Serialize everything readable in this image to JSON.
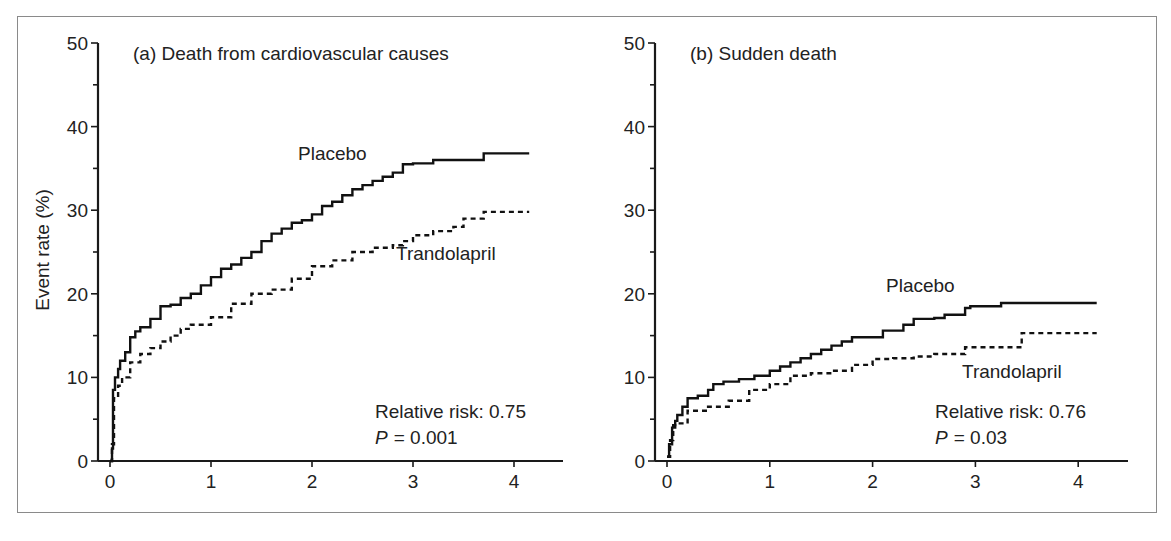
{
  "figure": {
    "y_axis_label": "Event rate (%)"
  },
  "chart_data": [
    {
      "type": "line",
      "panel": "a",
      "title": "(a) Death from cardiovascular causes",
      "xlabel": "",
      "ylabel": "Event rate (%)",
      "xlim": [
        0,
        4.5
      ],
      "ylim": [
        0,
        50
      ],
      "x_ticks": [
        "0",
        "1",
        "2",
        "3",
        "4"
      ],
      "y_ticks": [
        "0",
        "10",
        "20",
        "30",
        "40",
        "50"
      ],
      "grid": false,
      "series": [
        {
          "name": "Placebo",
          "style": "solid step",
          "x": [
            0,
            0.02,
            0.03,
            0.05,
            0.08,
            0.1,
            0.15,
            0.2,
            0.25,
            0.3,
            0.4,
            0.5,
            0.6,
            0.7,
            0.8,
            0.9,
            1.0,
            1.1,
            1.2,
            1.3,
            1.4,
            1.5,
            1.6,
            1.7,
            1.8,
            1.9,
            2.0,
            2.1,
            2.2,
            2.3,
            2.4,
            2.5,
            2.6,
            2.7,
            2.8,
            2.9,
            3.0,
            3.2,
            3.4,
            3.7,
            4.15
          ],
          "y": [
            0,
            1.5,
            8.5,
            10,
            11,
            12,
            13,
            14.8,
            15.5,
            16,
            17,
            18.5,
            18.7,
            19.5,
            20,
            21,
            22,
            23,
            23.5,
            24.3,
            25,
            26.3,
            27.2,
            27.8,
            28.5,
            28.8,
            29.5,
            30.5,
            31,
            31.8,
            32.5,
            33,
            33.5,
            34,
            34.5,
            35.5,
            35.6,
            36,
            36,
            36.8,
            36.8
          ]
        },
        {
          "name": "Trandolapril",
          "style": "dotted step",
          "x": [
            0,
            0.02,
            0.04,
            0.08,
            0.12,
            0.2,
            0.3,
            0.4,
            0.5,
            0.6,
            0.7,
            0.8,
            1.0,
            1.2,
            1.4,
            1.6,
            1.8,
            2.0,
            2.2,
            2.4,
            2.6,
            2.8,
            2.9,
            3.0,
            3.2,
            3.4,
            3.5,
            3.7,
            4.15
          ],
          "y": [
            0,
            2,
            7.5,
            9,
            10,
            11.8,
            12.8,
            13.5,
            14.3,
            15,
            15.8,
            16.3,
            17.2,
            18.8,
            20,
            20.5,
            21.8,
            23.3,
            24,
            25,
            25.5,
            25.8,
            26.3,
            27,
            27.5,
            28,
            29,
            29.8,
            29.8
          ]
        }
      ],
      "annotations": {
        "placebo_label": "Placebo",
        "trandolapril_label": "Trandolapril",
        "relative_risk": "Relative risk: 0.75",
        "p_symbol": "P",
        "p_value": "= 0.001"
      }
    },
    {
      "type": "line",
      "panel": "b",
      "title": "(b) Sudden death",
      "xlabel": "",
      "ylabel": "",
      "xlim": [
        0,
        4.5
      ],
      "ylim": [
        0,
        50
      ],
      "x_ticks": [
        "0",
        "1",
        "2",
        "3",
        "4"
      ],
      "y_ticks": [
        "0",
        "10",
        "20",
        "30",
        "40",
        "50"
      ],
      "grid": false,
      "series": [
        {
          "name": "Placebo",
          "style": "solid step",
          "x": [
            0,
            0.02,
            0.05,
            0.08,
            0.1,
            0.15,
            0.2,
            0.3,
            0.4,
            0.45,
            0.55,
            0.7,
            0.85,
            1.0,
            1.1,
            1.2,
            1.3,
            1.4,
            1.5,
            1.6,
            1.7,
            1.8,
            2.0,
            2.1,
            2.3,
            2.4,
            2.6,
            2.7,
            2.9,
            2.95,
            3.2,
            3.25,
            4.18
          ],
          "y": [
            0.5,
            2,
            4,
            4.8,
            5.5,
            6.5,
            7.5,
            7.8,
            8.5,
            9.2,
            9.5,
            9.8,
            10.2,
            10.8,
            11.3,
            11.8,
            12.3,
            12.8,
            13.3,
            13.8,
            14.3,
            14.8,
            14.8,
            15.6,
            16.3,
            17,
            17.1,
            17.5,
            18.3,
            18.5,
            18.5,
            18.9,
            18.9
          ]
        },
        {
          "name": "Trandolapril",
          "style": "dotted step",
          "x": [
            0,
            0.03,
            0.06,
            0.1,
            0.2,
            0.4,
            0.6,
            0.8,
            1.0,
            1.2,
            1.4,
            1.6,
            1.8,
            2.0,
            2.2,
            2.4,
            2.6,
            2.8,
            2.9,
            3.0,
            3.2,
            3.4,
            3.45,
            3.5,
            4.18
          ],
          "y": [
            0.5,
            2.5,
            4.3,
            4.5,
            6,
            6.5,
            7.2,
            8.5,
            9.2,
            10.2,
            10.5,
            10.8,
            11.5,
            12.2,
            12.3,
            12.5,
            12.8,
            12.8,
            13.6,
            13.6,
            13.6,
            13.6,
            15.3,
            15.3,
            15.3
          ]
        }
      ],
      "annotations": {
        "placebo_label": "Placebo",
        "trandolapril_label": "Trandolapril",
        "relative_risk": "Relative risk: 0.76",
        "p_symbol": "P",
        "p_value": "= 0.03"
      }
    }
  ]
}
